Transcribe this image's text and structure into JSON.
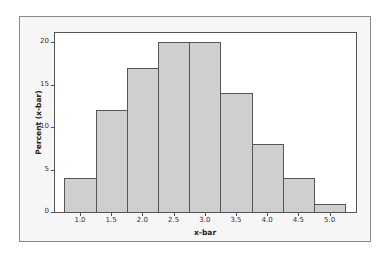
{
  "chart_data": {
    "type": "bar",
    "subtype": "histogram",
    "title": "",
    "xlabel": "x-bar",
    "ylabel": "Percent (x-bar)",
    "categories": [
      "1.0",
      "1.5",
      "2.0",
      "2.5",
      "3.0",
      "3.5",
      "4.0",
      "4.5",
      "5.0"
    ],
    "bin_centers": [
      1.0,
      1.5,
      2.0,
      2.5,
      3.0,
      3.5,
      4.0,
      4.5,
      5.0
    ],
    "values": [
      4,
      12,
      17,
      20,
      20,
      14,
      8,
      4,
      1
    ],
    "ylim": [
      0,
      21
    ],
    "yticks": [
      "0",
      "5",
      "10",
      "15",
      "20"
    ],
    "xticks": [
      "1.0",
      "1.5",
      "2.0",
      "2.5",
      "3.0",
      "3.5",
      "4.0",
      "4.5",
      "5.0"
    ],
    "grid": false,
    "legend": null,
    "bar_color": "#cfcfcf",
    "edge_color": "#555555"
  }
}
